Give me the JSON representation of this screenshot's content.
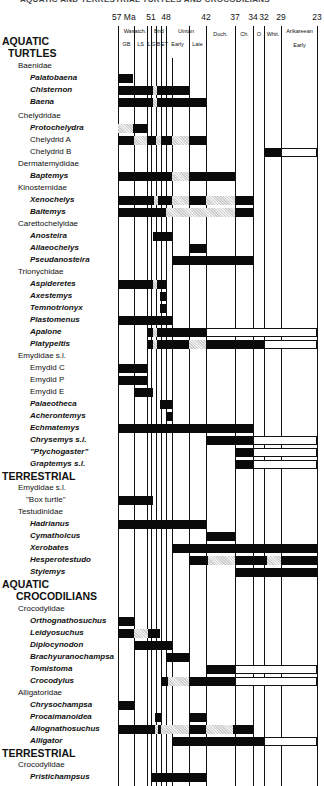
{
  "title": "AQUATIC AND TERRESTRIAL TURTLES AND CROCODILIANS",
  "chart_data": {
    "type": "range-chart",
    "title": "AQUATIC AND TERRESTRIAL TURTLES AND CROCODILIANS",
    "xlabel": "Ma",
    "ticks": [
      {
        "label": "57 Ma",
        "x": 118
      },
      {
        "label": "51",
        "x": 151
      },
      {
        "label": "48",
        "x": 166
      },
      {
        "label": "42",
        "x": 206
      },
      {
        "label": "37",
        "x": 235
      },
      {
        "label": "34",
        "x": 253
      },
      {
        "label": "32",
        "x": 264
      },
      {
        "label": "29",
        "x": 281
      },
      {
        "label": "23",
        "x": 317
      }
    ],
    "stages": [
      {
        "label": "Wasatch.",
        "x": 120,
        "w": 30,
        "y": 28
      },
      {
        "label": "Brid",
        "x": 152,
        "w": 14,
        "y": 28
      },
      {
        "label": "Uintan",
        "x": 167,
        "w": 38,
        "y": 28
      },
      {
        "label": "Duch.",
        "x": 207,
        "w": 27,
        "y": 31
      },
      {
        "label": "Ch.",
        "x": 236,
        "w": 17,
        "y": 31
      },
      {
        "label": "O",
        "x": 254,
        "w": 10,
        "y": 31
      },
      {
        "label": "Whit.",
        "x": 265,
        "w": 16,
        "y": 31
      },
      {
        "label": "Arikareean",
        "x": 282,
        "w": 35,
        "y": 28
      }
    ],
    "substages": [
      {
        "label": "GB",
        "x": 119,
        "w": 15
      },
      {
        "label": "LS",
        "x": 134,
        "w": 13
      },
      {
        "label": "L",
        "x": 147,
        "w": 4
      },
      {
        "label": "G",
        "x": 151,
        "w": 5
      },
      {
        "label": "B",
        "x": 156,
        "w": 5
      },
      {
        "label": "ET",
        "x": 161,
        "w": 5
      },
      {
        "label": "Early",
        "x": 166,
        "w": 23
      },
      {
        "label": "Late",
        "x": 189,
        "w": 17
      },
      {
        "label": "Early",
        "x": 282,
        "w": 35,
        "y": 42
      }
    ],
    "column_lines": [
      118,
      134,
      147,
      151,
      156,
      161,
      166,
      172,
      189,
      206,
      235,
      253,
      264,
      281,
      317
    ],
    "rows": [
      {
        "label": "AQUATIC",
        "kind": "group",
        "y": 44
      },
      {
        "label": "TURTLES",
        "kind": "group",
        "y": 56,
        "indent": 6
      },
      {
        "label": "Baenidae",
        "kind": "family",
        "y": 69
      },
      {
        "label": "Palatobaena",
        "kind": "taxon",
        "y": 81,
        "bars": [
          [
            118,
            133,
            "s"
          ]
        ]
      },
      {
        "label": "Chisternon",
        "kind": "taxon",
        "y": 93,
        "bars": [
          [
            118,
            153,
            "s"
          ],
          [
            153,
            157,
            "p"
          ],
          [
            157,
            189,
            "s"
          ]
        ]
      },
      {
        "label": "Baena",
        "kind": "taxon",
        "y": 105,
        "bars": [
          [
            118,
            153,
            "s"
          ],
          [
            153,
            157,
            "p"
          ],
          [
            157,
            206,
            "s"
          ]
        ]
      },
      {
        "label": "Chelydridae",
        "kind": "family",
        "y": 119
      },
      {
        "label": "Protochelydra",
        "kind": "taxon",
        "y": 131,
        "bars": [
          [
            118,
            133,
            "p"
          ],
          [
            133,
            147,
            "s"
          ]
        ]
      },
      {
        "label": "Chelydrid  A",
        "kind": "taxon plain",
        "y": 143,
        "bars": [
          [
            118,
            134,
            "s"
          ],
          [
            134,
            147,
            "p"
          ],
          [
            147,
            156,
            "s"
          ],
          [
            156,
            161,
            "p"
          ],
          [
            161,
            172,
            "s"
          ],
          [
            172,
            189,
            "p"
          ],
          [
            189,
            206,
            "s"
          ]
        ]
      },
      {
        "label": "Chelydrid  B",
        "kind": "taxon plain",
        "y": 155,
        "bars": [
          [
            264,
            281,
            "s"
          ],
          [
            281,
            317,
            "o"
          ]
        ]
      },
      {
        "label": "Dermatemydidae",
        "kind": "family",
        "y": 167
      },
      {
        "label": "Baptemys",
        "kind": "taxon",
        "y": 179,
        "bars": [
          [
            118,
            172,
            "s"
          ],
          [
            172,
            189,
            "p"
          ],
          [
            189,
            235,
            "s"
          ]
        ]
      },
      {
        "label": "Kinosternidae",
        "kind": "family",
        "y": 191
      },
      {
        "label": "Xenochelys",
        "kind": "taxon",
        "y": 203,
        "bars": [
          [
            118,
            154,
            "s"
          ],
          [
            154,
            158,
            "p"
          ],
          [
            158,
            172,
            "s"
          ],
          [
            172,
            189,
            "p"
          ],
          [
            189,
            206,
            "s"
          ],
          [
            206,
            235,
            "p"
          ],
          [
            235,
            253,
            "s"
          ]
        ]
      },
      {
        "label": "Baltemys",
        "kind": "taxon",
        "y": 215,
        "bars": [
          [
            118,
            166,
            "s"
          ],
          [
            166,
            235,
            "p"
          ],
          [
            235,
            253,
            "s"
          ]
        ]
      },
      {
        "label": "Carettochelyidae",
        "kind": "family",
        "y": 227
      },
      {
        "label": "Anosteira",
        "kind": "taxon",
        "y": 239,
        "bars": [
          [
            153,
            172,
            "s"
          ]
        ]
      },
      {
        "label": "Allaeochelys",
        "kind": "taxon",
        "y": 251,
        "bars": [
          [
            189,
            206,
            "s"
          ]
        ]
      },
      {
        "label": "Pseudanosteira",
        "kind": "taxon",
        "y": 263,
        "bars": [
          [
            172,
            253,
            "s"
          ]
        ]
      },
      {
        "label": "Trionychidae",
        "kind": "family",
        "y": 275
      },
      {
        "label": "Aspideretes",
        "kind": "taxon",
        "y": 287,
        "bars": [
          [
            118,
            153,
            "s"
          ],
          [
            153,
            157,
            "p"
          ],
          [
            157,
            166,
            "s"
          ]
        ]
      },
      {
        "label": "Axestemys",
        "kind": "taxon",
        "y": 299,
        "bars": [
          [
            160,
            166,
            "s"
          ]
        ]
      },
      {
        "label": "Temnotrionyx",
        "kind": "taxon",
        "y": 311,
        "bars": [
          [
            160,
            166,
            "s"
          ]
        ]
      },
      {
        "label": "Plastomenus",
        "kind": "taxon",
        "y": 323,
        "bars": [
          [
            118,
            172,
            "s"
          ]
        ]
      },
      {
        "label": "Apalone",
        "kind": "taxon",
        "y": 335,
        "bars": [
          [
            148,
            153,
            "s"
          ],
          [
            153,
            157,
            "p"
          ],
          [
            157,
            206,
            "s"
          ],
          [
            206,
            317,
            "o"
          ]
        ]
      },
      {
        "label": "Platypeltis",
        "kind": "taxon",
        "y": 347,
        "bars": [
          [
            148,
            153,
            "s"
          ],
          [
            153,
            157,
            "p"
          ],
          [
            157,
            189,
            "s"
          ],
          [
            189,
            206,
            "p"
          ],
          [
            206,
            264,
            "s"
          ],
          [
            264,
            317,
            "o"
          ]
        ]
      },
      {
        "label": "Emydidae s.l.",
        "kind": "family",
        "y": 359
      },
      {
        "label": "Emydid C",
        "kind": "taxon plain",
        "y": 371,
        "bars": [
          [
            118,
            147,
            "s"
          ]
        ]
      },
      {
        "label": "Emydid P",
        "kind": "taxon plain",
        "y": 383,
        "bars": [
          [
            118,
            147,
            "s"
          ]
        ]
      },
      {
        "label": "Emydid E",
        "kind": "taxon plain",
        "y": 395,
        "bars": [
          [
            134,
            153,
            "s"
          ]
        ]
      },
      {
        "label": "Palaeotheca",
        "kind": "taxon",
        "y": 407,
        "bars": [
          [
            160,
            172,
            "s"
          ]
        ]
      },
      {
        "label": "Acherontemys",
        "kind": "taxon",
        "y": 419,
        "bars": [
          [
            166,
            172,
            "s"
          ]
        ]
      },
      {
        "label": "Echmatemys",
        "kind": "taxon",
        "y": 431,
        "bars": [
          [
            118,
            253,
            "s"
          ]
        ]
      },
      {
        "label": "Chrysemys  s.l.",
        "kind": "taxon",
        "y": 443,
        "bars": [
          [
            206,
            253,
            "s"
          ],
          [
            253,
            317,
            "o"
          ]
        ]
      },
      {
        "label": "\"Ptychogaster\"",
        "kind": "taxon",
        "y": 455,
        "bars": [
          [
            235,
            253,
            "s"
          ],
          [
            253,
            317,
            "o"
          ]
        ]
      },
      {
        "label": "Graptemys  s.l.",
        "kind": "taxon",
        "y": 467,
        "bars": [
          [
            235,
            253,
            "s"
          ],
          [
            253,
            317,
            "o"
          ]
        ]
      },
      {
        "label": "TERRESTRIAL",
        "kind": "group",
        "y": 479
      },
      {
        "label": "Emydidae s.l.",
        "kind": "family",
        "y": 491
      },
      {
        "label": "\"Box turtle\"",
        "kind": "taxon plain",
        "y": 503,
        "bars": [
          [
            118,
            153,
            "s"
          ]
        ]
      },
      {
        "label": "Testudinidae",
        "kind": "family",
        "y": 515
      },
      {
        "label": "Hadrianus",
        "kind": "taxon",
        "y": 527,
        "bars": [
          [
            118,
            206,
            "s"
          ]
        ]
      },
      {
        "label": "Cymatholcus",
        "kind": "taxon",
        "y": 539,
        "bars": [
          [
            206,
            235,
            "s"
          ]
        ]
      },
      {
        "label": "Xerobates",
        "kind": "taxon",
        "y": 551,
        "bars": [
          [
            172,
            317,
            "s"
          ]
        ]
      },
      {
        "label": "Hesperotestudo",
        "kind": "taxon",
        "y": 563,
        "bars": [
          [
            189,
            208,
            "s"
          ],
          [
            208,
            235,
            "p"
          ],
          [
            235,
            267,
            "s"
          ],
          [
            267,
            281,
            "p"
          ],
          [
            281,
            317,
            "s"
          ]
        ]
      },
      {
        "label": "Stylemys",
        "kind": "taxon",
        "y": 575,
        "bars": [
          [
            235,
            317,
            "s"
          ]
        ]
      },
      {
        "label": "AQUATIC",
        "kind": "group",
        "y": 587
      },
      {
        "label": "CROCODILIANS",
        "kind": "group",
        "y": 599,
        "indent": 14
      },
      {
        "label": "Crocodylidae",
        "kind": "family",
        "y": 612
      },
      {
        "label": "Orthognathosuchus",
        "kind": "taxon",
        "y": 624,
        "bars": [
          [
            118,
            134,
            "s"
          ]
        ]
      },
      {
        "label": "Leidyosuchus",
        "kind": "taxon",
        "y": 636,
        "bars": [
          [
            118,
            134,
            "s"
          ],
          [
            134,
            148,
            "p"
          ],
          [
            148,
            160,
            "s"
          ]
        ]
      },
      {
        "label": "Diplocynodon",
        "kind": "taxon",
        "y": 648,
        "bars": [
          [
            134,
            172,
            "s"
          ]
        ]
      },
      {
        "label": "Brachyuranochampsa",
        "kind": "taxon",
        "y": 660,
        "bars": [
          [
            166,
            189,
            "s"
          ]
        ]
      },
      {
        "label": "Tomistoma",
        "kind": "taxon",
        "y": 672,
        "bars": [
          [
            206,
            235,
            "s"
          ],
          [
            235,
            317,
            "o"
          ]
        ]
      },
      {
        "label": "Crocodylus",
        "kind": "taxon",
        "y": 684,
        "bars": [
          [
            161,
            168,
            "s"
          ],
          [
            168,
            189,
            "p"
          ],
          [
            189,
            235,
            "s"
          ],
          [
            235,
            317,
            "o"
          ]
        ]
      },
      {
        "label": "Alligatoridae",
        "kind": "family",
        "y": 696
      },
      {
        "label": "Chrysochampsa",
        "kind": "taxon",
        "y": 708,
        "bars": [
          [
            118,
            134,
            "s"
          ]
        ]
      },
      {
        "label": "Procaimanoidea",
        "kind": "taxon",
        "y": 720,
        "bars": [
          [
            155,
            161,
            "s"
          ],
          [
            189,
            206,
            "s"
          ]
        ]
      },
      {
        "label": "Allognathosuchus",
        "kind": "taxon",
        "y": 732,
        "bars": [
          [
            118,
            155,
            "s"
          ],
          [
            155,
            158,
            "p"
          ],
          [
            158,
            161,
            "s"
          ],
          [
            161,
            166,
            "p"
          ],
          [
            166,
            189,
            "p"
          ],
          [
            189,
            206,
            "s"
          ],
          [
            206,
            233,
            "p"
          ],
          [
            233,
            253,
            "s"
          ]
        ]
      },
      {
        "label": "Alligator",
        "kind": "taxon",
        "y": 744,
        "bars": [
          [
            172,
            264,
            "s"
          ],
          [
            264,
            317,
            "o"
          ]
        ]
      },
      {
        "label": "TERRESTRIAL",
        "kind": "group",
        "y": 756
      },
      {
        "label": "Crocodylidae",
        "kind": "family",
        "y": 768
      },
      {
        "label": "Pristichampsus",
        "kind": "taxon",
        "y": 780,
        "bars": [
          [
            151,
            206,
            "s"
          ]
        ]
      }
    ],
    "legend": {
      "s": "solid black = documented record",
      "p": "stippled = inferred/sparse",
      "o": "open = range extension"
    }
  }
}
